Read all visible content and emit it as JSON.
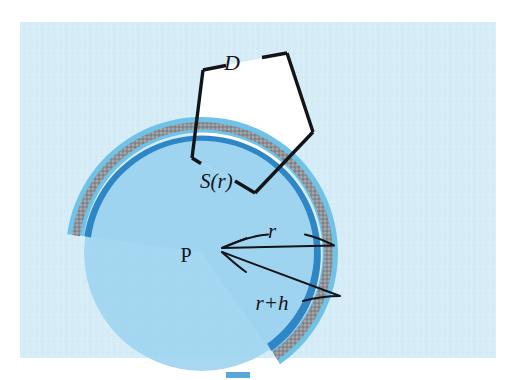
{
  "figure": {
    "background_color": "#d6edf7",
    "canvas_color": "#ffffff",
    "labels": {
      "domain": "D",
      "shell": "S(r)",
      "point": "P",
      "radius": "r",
      "radius_plus_h": "r+h"
    },
    "colors": {
      "band_fill": "#8f9296",
      "band_outer_edge": "#6fc2e8",
      "band_inner_edge": "#2f86c6",
      "interior_fill": "#9ed4ef",
      "outline": "#111418",
      "polygon_fill": "#ffffff",
      "background": "#d6edf7",
      "swatch": "#5aa8d8"
    },
    "geometry": {
      "center_x": 202,
      "center_y": 253,
      "inner_radius": 118,
      "outer_radius": 136,
      "arc_start_deg": 188,
      "arc_end_deg": 55,
      "polygon_vertices": [
        [
          203,
          70
        ],
        [
          287,
          53
        ],
        [
          313,
          132
        ],
        [
          255,
          193
        ],
        [
          192,
          158
        ]
      ]
    },
    "annotations": [
      {
        "name": "radius-arrow",
        "label": "r",
        "from": [
          222,
          248
        ],
        "to": [
          337,
          245
        ]
      },
      {
        "name": "radius-plus-h-arrow",
        "label": "r+h",
        "from": [
          222,
          252
        ],
        "to": [
          342,
          297
        ]
      }
    ],
    "swatch": {
      "x": 226,
      "y": 372,
      "width": 24,
      "height": 6
    }
  }
}
